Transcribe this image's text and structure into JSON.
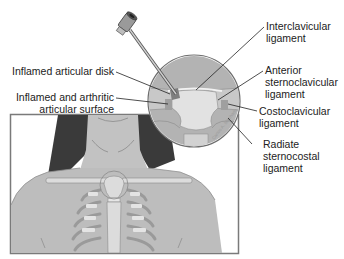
{
  "diagram": {
    "type": "medical-illustration",
    "labels_left": [
      {
        "id": "inflamed-articular-disk",
        "lines": [
          "Inflamed articular disk"
        ]
      },
      {
        "id": "inflamed-arthritic-surface",
        "lines": [
          "Inflamed and arthritic",
          "articular surface"
        ]
      }
    ],
    "labels_right": [
      {
        "id": "interclavicular-ligament",
        "lines": [
          "Interclavicular",
          "ligament"
        ]
      },
      {
        "id": "anterior-sternoclavicular-ligament",
        "lines": [
          "Anterior",
          "sternoclavicular",
          "ligament"
        ]
      },
      {
        "id": "costoclavicular-ligament",
        "lines": [
          "Costoclavicular",
          "ligament"
        ]
      },
      {
        "id": "radiate-sternocostal-ligament",
        "lines": [
          "Radiate",
          "sternocostal",
          "ligament"
        ]
      }
    ],
    "watermark": "Carlos A. Machado",
    "colors": {
      "skin": "#bdbdbd",
      "hair": "#3a3a3a",
      "bone": "#dcdcdc",
      "cartilage": "#ededed",
      "magnifier_fill": "#b3b3b3",
      "outline": "#6e6e6e",
      "leader_line": "#222222",
      "frame": "#7a7a7a"
    }
  }
}
